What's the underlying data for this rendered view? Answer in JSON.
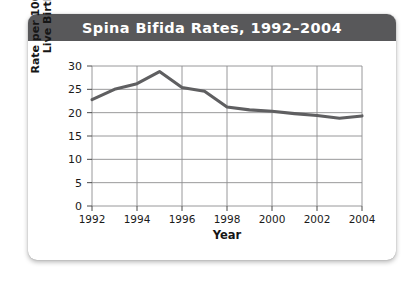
{
  "card": {
    "title": "Spina Bifida Rates, 1992–2004"
  },
  "chart_data": {
    "type": "line",
    "title": "Spina Bifida Rates, 1992–2004",
    "xlabel": "Year",
    "ylabel": "Rate per 100,000 Live Births",
    "ylabel_line1": "Rate per 100,000",
    "ylabel_line2": "Live Births",
    "x": [
      1992,
      1993,
      1994,
      1995,
      1996,
      1997,
      1998,
      1999,
      2000,
      2001,
      2002,
      2003,
      2004
    ],
    "values": [
      22.8,
      25.0,
      26.2,
      28.8,
      25.4,
      24.6,
      21.2,
      20.6,
      20.3,
      19.8,
      19.4,
      18.8,
      19.3
    ],
    "series": [
      {
        "name": "Spina bifida rate",
        "values": [
          22.8,
          25.0,
          26.2,
          28.8,
          25.4,
          24.6,
          21.2,
          20.6,
          20.3,
          19.8,
          19.4,
          18.8,
          19.3
        ]
      }
    ],
    "xlim": [
      1992,
      2004
    ],
    "ylim": [
      0,
      30
    ],
    "yticks": [
      0,
      5,
      10,
      15,
      20,
      25,
      30
    ],
    "ytick_labels": [
      "0",
      "5",
      "10",
      "15",
      "20",
      "25",
      "30"
    ],
    "xticks": [
      1992,
      1994,
      1996,
      1998,
      2000,
      2002,
      2004
    ],
    "xtick_labels": [
      "1992",
      "1994",
      "1996",
      "1998",
      "2000",
      "2002",
      "2004"
    ],
    "grid": true,
    "legend": false,
    "line_color": "#5f5f61",
    "grid_color": "#8d8d8f",
    "plot_bg": "#ffffff",
    "title_bar_color": "#58585a"
  }
}
